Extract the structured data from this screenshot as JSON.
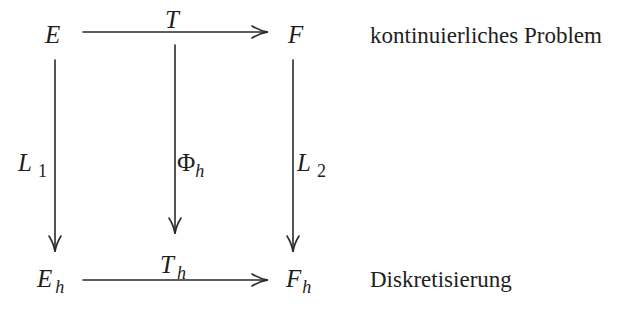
{
  "diagram": {
    "type": "commutative-diagram",
    "nodes": {
      "E": {
        "main": "E",
        "sub": ""
      },
      "F": {
        "main": "F",
        "sub": ""
      },
      "Eh": {
        "main": "E",
        "sub": "h"
      },
      "Fh": {
        "main": "F",
        "sub": "h"
      }
    },
    "arrows": {
      "top": {
        "label_main": "T",
        "label_sub": "",
        "from": "E",
        "to": "F"
      },
      "bottom": {
        "label_main": "T",
        "label_sub": "h",
        "from": "E_h",
        "to": "F_h"
      },
      "left": {
        "label_main": "L",
        "label_sub": "1",
        "from": "E",
        "to": "E_h"
      },
      "middle": {
        "label_main": "Φ",
        "label_sub": "h",
        "from": "T",
        "to": "T_h"
      },
      "right": {
        "label_main": "L",
        "label_sub": "2",
        "from": "F",
        "to": "F_h"
      }
    },
    "row_labels": {
      "top": "kontinuierliches Problem",
      "bottom": "Diskretisierung"
    },
    "colors": {
      "line": "#2a2a2a",
      "text": "#1e1e1e",
      "background": "#ffffff"
    }
  }
}
